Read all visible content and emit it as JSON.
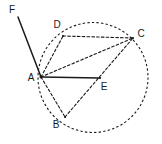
{
  "figure": {
    "type": "euclidean-geometry-diagram",
    "canvas": {
      "width": 162,
      "height": 144
    },
    "colors": {
      "background": "#ffffff",
      "stroke": "#1a1a1a",
      "label": "#1a1a1a"
    },
    "circle": {
      "name": "circle",
      "cx": 93,
      "cy": 77.5,
      "r": 55,
      "style": "dashed"
    },
    "points": [
      {
        "id": "A",
        "label": "A",
        "x": 41,
        "y": 77,
        "label_x": 31,
        "label_y": 78,
        "on_circle": true
      },
      {
        "id": "B",
        "label": "B",
        "x": 65,
        "y": 117,
        "label_x": 56,
        "label_y": 125,
        "on_circle": true
      },
      {
        "id": "C",
        "label": "C",
        "x": 133,
        "y": 38,
        "label_x": 141,
        "label_y": 34,
        "on_circle": true
      },
      {
        "id": "D",
        "label": "D",
        "x": 63,
        "y": 36,
        "label_x": 57,
        "label_y": 25,
        "on_circle": true
      },
      {
        "id": "E",
        "label": "E",
        "x": 100,
        "y": 78,
        "label_x": 104,
        "label_y": 87,
        "on_circle": false
      },
      {
        "id": "F",
        "label": "F",
        "x": 18,
        "y": 17,
        "label_x": 12,
        "label_y": 10,
        "on_circle": false
      }
    ],
    "segments": [
      {
        "name": "segment-F-A",
        "from": "F",
        "to": "A",
        "style": "solid"
      },
      {
        "name": "segment-A-E",
        "from": "A",
        "to": "E",
        "style": "solid"
      },
      {
        "name": "segment-A-D",
        "from": "A",
        "to": "D",
        "style": "dashed"
      },
      {
        "name": "segment-A-C",
        "from": "A",
        "to": "C",
        "style": "dashed"
      },
      {
        "name": "segment-D-C",
        "from": "D",
        "to": "C",
        "style": "dashed"
      },
      {
        "name": "segment-A-B",
        "from": "A",
        "to": "B",
        "style": "dashed"
      },
      {
        "name": "segment-B-C",
        "from": "B",
        "to": "C",
        "style": "dashed"
      }
    ]
  }
}
